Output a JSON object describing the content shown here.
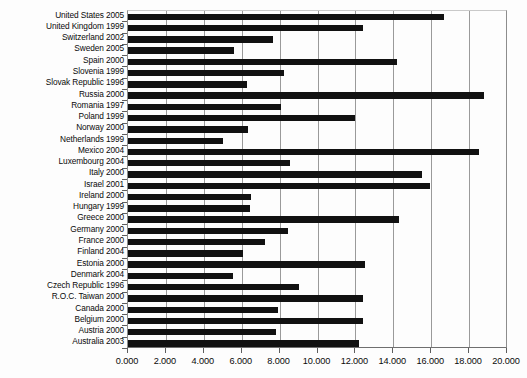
{
  "chart_data": {
    "type": "bar",
    "orientation": "horizontal",
    "title": "",
    "subtitle": "",
    "xlabel": "",
    "ylabel": "",
    "xlim": [
      0,
      20
    ],
    "xtick_step": 2,
    "grid": true,
    "legend": null,
    "bar_color": "#111111",
    "axis_color": "#8d8d8d",
    "grid_color": "#9a9a9a",
    "tick_labels": [
      "0.000",
      "2.000",
      "4.000",
      "6.000",
      "8.000",
      "10.000",
      "12.000",
      "14.000",
      "16.000",
      "18.000",
      "20.000"
    ],
    "tick_values": [
      0,
      2,
      4,
      6,
      8,
      10,
      12,
      14,
      16,
      18,
      20
    ],
    "categories": [
      "United States 2005",
      "United Kingdom 1999",
      "Switzerland 2002",
      "Sweden 2005",
      "Spain 2000",
      "Slovenia 1999",
      "Slovak Republic 1996",
      "Russia 2000",
      "Romania 1997",
      "Poland 1999",
      "Norway 2000",
      "Netherlands 1999",
      "Mexico 2004",
      "Luxembourg 2004",
      "Italy 2000",
      "Israel 2001",
      "Ireland 2000",
      "Hungary 1999",
      "Greece 2000",
      "Germany 2000",
      "France 2000",
      "Finland 2004",
      "Estonia 2000",
      "Denmark 2004",
      "Czech Republic 1996",
      "R.O.C. Taiwan 2000",
      "Canada 2000",
      "Belgium 2000",
      "Austria 2000",
      "Australia 2003"
    ],
    "values": [
      16.7,
      12.4,
      7.65,
      5.6,
      14.2,
      8.25,
      6.3,
      18.8,
      8.05,
      12.0,
      6.35,
      5.0,
      18.5,
      8.55,
      15.5,
      15.95,
      6.5,
      6.45,
      14.3,
      8.45,
      7.25,
      6.05,
      12.5,
      5.55,
      9.0,
      12.4,
      7.9,
      12.4,
      7.8,
      12.2
    ]
  }
}
